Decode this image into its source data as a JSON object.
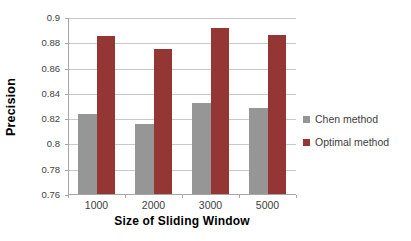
{
  "chart_data": {
    "type": "bar",
    "title": "",
    "categories": [
      "1000",
      "2000",
      "3000",
      "5000"
    ],
    "series": [
      {
        "name": "Chen method",
        "color": "#969696",
        "values": [
          0.823,
          0.815,
          0.832,
          0.828
        ]
      },
      {
        "name": "Optimal method",
        "color": "#943634",
        "values": [
          0.885,
          0.875,
          0.891,
          0.886
        ]
      }
    ],
    "xlabel": "Size of Sliding Window",
    "ylabel": "Precision",
    "ylim": [
      0.76,
      0.9
    ],
    "ytick_step": 0.02,
    "yticks": [
      "0.9",
      "0.88",
      "0.86",
      "0.84",
      "0.82",
      "0.8",
      "0.78",
      "0.76"
    ],
    "ytick_values": [
      0.9,
      0.88,
      0.86,
      0.84,
      0.82,
      0.8,
      0.78,
      0.76
    ],
    "grid": true,
    "legend_position": "right",
    "colors": {
      "gridline": "#c9c9c9",
      "axis": "#a6a6a6",
      "tick_text": "#404040",
      "legend_text": "#404040",
      "axis_title_text": "#000000"
    }
  }
}
